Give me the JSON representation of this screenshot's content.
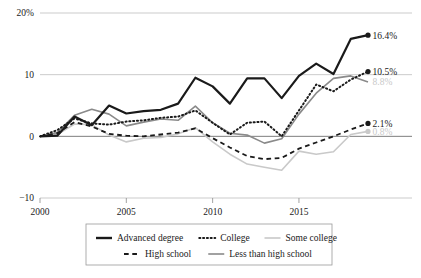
{
  "chart_data": {
    "type": "line",
    "title": "",
    "subtitle": "",
    "xlabel": "",
    "ylabel": "",
    "xlim": [
      2000,
      2019
    ],
    "ylim": [
      -10,
      20
    ],
    "grid": true,
    "grid_axis": "y",
    "legend_position": "bottom",
    "y_ticks": [
      {
        "value": 20,
        "label": "20%"
      },
      {
        "value": 10,
        "label": "10"
      },
      {
        "value": 0,
        "label": "0"
      },
      {
        "value": -10,
        "label": "−10"
      }
    ],
    "x_ticks": [
      {
        "value": 2000,
        "label": "2000"
      },
      {
        "value": 2005,
        "label": "2005"
      },
      {
        "value": 2010,
        "label": "2010"
      },
      {
        "value": 2015,
        "label": "2015"
      }
    ],
    "x": [
      2000,
      2001,
      2002,
      2003,
      2004,
      2005,
      2006,
      2007,
      2008,
      2009,
      2010,
      2011,
      2012,
      2013,
      2014,
      2015,
      2016,
      2017,
      2018,
      2019
    ],
    "series": [
      {
        "name": "Advanced degree",
        "style": "solid",
        "color": "#1a1a1a",
        "width": 2.2,
        "end_label": "16.4%",
        "end_label_color": "#1a1a1a",
        "end_marker": true,
        "values": [
          0.0,
          0.1,
          3.2,
          1.8,
          5.0,
          3.7,
          4.1,
          4.3,
          5.3,
          9.5,
          8.1,
          5.3,
          9.4,
          9.4,
          6.2,
          9.8,
          11.8,
          10.1,
          15.8,
          16.4
        ]
      },
      {
        "name": "College",
        "style": "dotted",
        "color": "#1a1a1a",
        "width": 2.0,
        "end_label": "10.5%",
        "end_label_color": "#1a1a1a",
        "end_marker": true,
        "values": [
          0.0,
          1.0,
          2.9,
          2.1,
          1.9,
          2.4,
          2.6,
          3.0,
          3.2,
          4.2,
          2.2,
          0.3,
          2.2,
          2.4,
          0.0,
          4.2,
          8.4,
          7.3,
          9.2,
          10.5
        ]
      },
      {
        "name": "Some college",
        "style": "solid",
        "color": "#c9c9c9",
        "width": 1.6,
        "end_label": "0.8%",
        "end_label_color": "#c9c9c9",
        "end_marker": true,
        "values": [
          0.0,
          0.3,
          2.0,
          1.9,
          0.2,
          -0.9,
          -0.3,
          -0.2,
          0.4,
          1.4,
          -0.9,
          -2.9,
          -4.5,
          -5.0,
          -5.5,
          -2.4,
          -2.9,
          -2.5,
          0.3,
          0.8
        ]
      },
      {
        "name": "High school",
        "style": "dashed",
        "color": "#1a1a1a",
        "width": 1.8,
        "end_label": "2.1%",
        "end_label_color": "#1a1a1a",
        "end_marker": true,
        "values": [
          0.0,
          0.5,
          2.3,
          1.6,
          0.4,
          0.1,
          0.0,
          0.3,
          0.6,
          1.3,
          -0.3,
          -1.8,
          -3.2,
          -3.7,
          -3.5,
          -2.0,
          -1.0,
          0.0,
          1.1,
          2.1
        ]
      },
      {
        "name": "Less than high school",
        "style": "solid",
        "color": "#8a8a8a",
        "width": 1.6,
        "end_label": "8.8%",
        "end_label_color": "#c9c9c9",
        "end_marker": false,
        "values": [
          0.0,
          0.6,
          3.4,
          4.4,
          3.6,
          1.7,
          2.3,
          2.8,
          2.6,
          4.9,
          2.2,
          0.5,
          0.2,
          -1.1,
          -0.4,
          3.6,
          7.0,
          9.4,
          9.8,
          8.8
        ]
      }
    ],
    "end_labels": [
      {
        "text": "16.4%",
        "color": "#1a1a1a",
        "series": "Advanced degree"
      },
      {
        "text": "10.5%",
        "color": "#1a1a1a",
        "series": "College"
      },
      {
        "text": "8.8%",
        "color": "#c9c9c9",
        "series": "Less than high school"
      },
      {
        "text": "2.1%",
        "color": "#1a1a1a",
        "series": "High school"
      },
      {
        "text": "0.8%",
        "color": "#d8d8d8",
        "series": "Some college"
      }
    ],
    "legend": {
      "rows": [
        [
          {
            "label": "Advanced degree",
            "style": "solid",
            "color": "#1a1a1a",
            "width": 2.4
          },
          {
            "label": "College",
            "style": "dotted",
            "color": "#1a1a1a",
            "width": 2.0
          },
          {
            "label": "Some college",
            "style": "solid",
            "color": "#c9c9c9",
            "width": 1.6
          }
        ],
        [
          {
            "label": "High school",
            "style": "dashed",
            "color": "#1a1a1a",
            "width": 1.8
          },
          {
            "label": "Less than high school",
            "style": "solid",
            "color": "#8a8a8a",
            "width": 1.6
          }
        ]
      ]
    },
    "colors": {
      "axis": "#8c8c8c",
      "grid": "#b5b5b5",
      "zero_line": "#6e6e6e",
      "text": "#1a1a1a",
      "legend_border": "#9a9a9a",
      "background": "#ffffff"
    }
  }
}
